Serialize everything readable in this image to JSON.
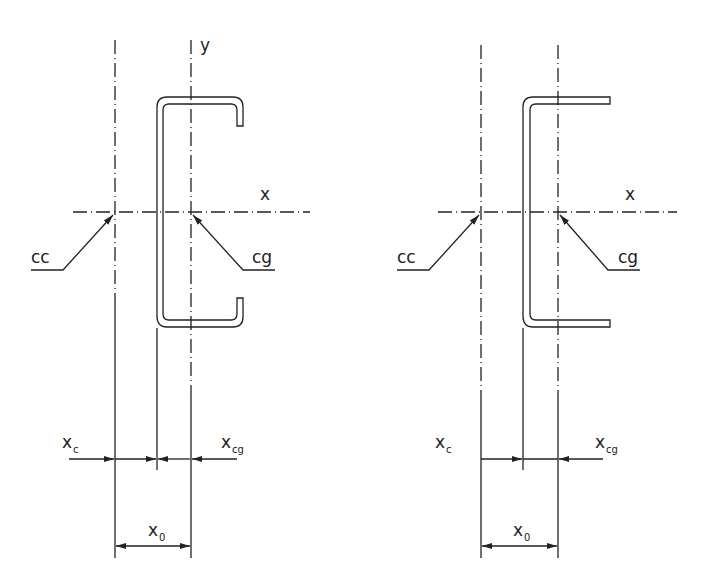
{
  "figures": [
    {
      "name": "lipped-channel-section",
      "labels": {
        "y_axis": "y",
        "x_axis": "x",
        "shear_center": "cc",
        "centroid": "cg",
        "xc_main": "x",
        "xc_sub": "c",
        "xcg_main": "x",
        "xcg_sub": "cg",
        "x0_main": "x",
        "x0_sub": "0"
      }
    },
    {
      "name": "plain-channel-section",
      "labels": {
        "x_axis": "x",
        "shear_center": "cc",
        "centroid": "cg",
        "xc_main": "x",
        "xc_sub": "c",
        "xcg_main": "x",
        "xcg_sub": "cg",
        "x0_main": "x",
        "x0_sub": "0"
      }
    }
  ],
  "colors": {
    "line": "#222222",
    "background": "#ffffff"
  }
}
